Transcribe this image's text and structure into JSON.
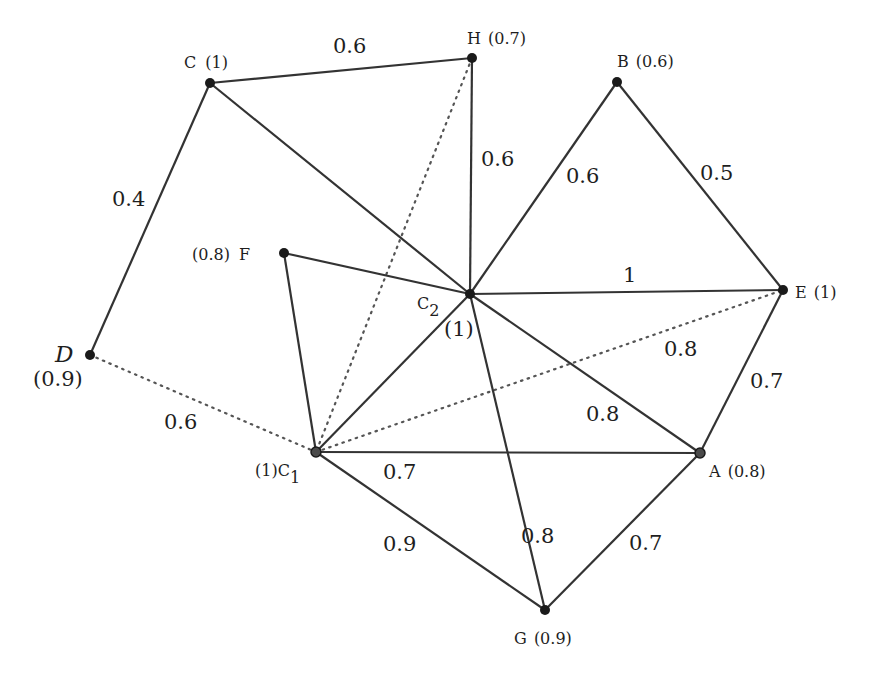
{
  "nodes": {
    "C": {
      "name": "C",
      "value": "(1)",
      "x": 210,
      "y": 83
    },
    "H": {
      "name": "H",
      "value": "(0.7)",
      "x": 472,
      "y": 58
    },
    "B": {
      "name": "B",
      "value": "(0.6)",
      "x": 617,
      "y": 82
    },
    "E": {
      "name": "E",
      "value": "(1)",
      "x": 783,
      "y": 290
    },
    "C2": {
      "name": "C",
      "sub": "2",
      "value": "(1)",
      "x": 470,
      "y": 294
    },
    "F": {
      "name": "F",
      "value": "(0.8)",
      "x": 284,
      "y": 253
    },
    "D": {
      "name": "D",
      "value": "(0.9)",
      "x": 90,
      "y": 355
    },
    "C1": {
      "name": "C",
      "sub": "1",
      "value": "(1)",
      "x": 316,
      "y": 452
    },
    "A": {
      "name": "A",
      "value": "(0.8)",
      "x": 700,
      "y": 453
    },
    "G": {
      "name": "G",
      "value": "(0.9)",
      "x": 545,
      "y": 610
    }
  },
  "edges": [
    {
      "from": "C",
      "to": "H",
      "weight": "0.6",
      "style": "solid"
    },
    {
      "from": "C",
      "to": "D",
      "weight": "0.4",
      "style": "solid"
    },
    {
      "from": "C",
      "to": "C2",
      "weight": "",
      "style": "solid"
    },
    {
      "from": "H",
      "to": "C2",
      "weight": "0.6",
      "style": "solid"
    },
    {
      "from": "H",
      "to": "C1",
      "weight": "",
      "style": "dotted"
    },
    {
      "from": "B",
      "to": "C2",
      "weight": "0.6",
      "style": "solid"
    },
    {
      "from": "B",
      "to": "E",
      "weight": "0.5",
      "style": "solid"
    },
    {
      "from": "C2",
      "to": "E",
      "weight": "1",
      "style": "solid"
    },
    {
      "from": "F",
      "to": "C2",
      "weight": "",
      "style": "solid"
    },
    {
      "from": "F",
      "to": "C1",
      "weight": "",
      "style": "solid"
    },
    {
      "from": "C1",
      "to": "C2",
      "weight": "",
      "style": "solid"
    },
    {
      "from": "C1",
      "to": "E",
      "weight": "0.8",
      "style": "dotted"
    },
    {
      "from": "D",
      "to": "C1",
      "weight": "0.6",
      "style": "dotted"
    },
    {
      "from": "C2",
      "to": "A",
      "weight": "0.8",
      "style": "solid"
    },
    {
      "from": "E",
      "to": "A",
      "weight": "0.7",
      "style": "solid"
    },
    {
      "from": "C1",
      "to": "A",
      "weight": "0.7",
      "style": "solid"
    },
    {
      "from": "C1",
      "to": "G",
      "weight": "0.9",
      "style": "solid"
    },
    {
      "from": "C2",
      "to": "G",
      "weight": "0.8",
      "style": "solid"
    },
    {
      "from": "A",
      "to": "G",
      "weight": "0.7",
      "style": "solid"
    }
  ],
  "edge_labels": {
    "C_H": "0.6",
    "C_D": "0.4",
    "H_C2": "0.6",
    "B_C2": "0.6",
    "B_E": "0.5",
    "C2_E": "1",
    "C1_E": "0.8",
    "D_C1": "0.6",
    "C2_A": "0.8",
    "E_A": "0.7",
    "C1_A": "0.7",
    "C1_G": "0.9",
    "C2_G": "0.8",
    "A_G": "0.7"
  }
}
